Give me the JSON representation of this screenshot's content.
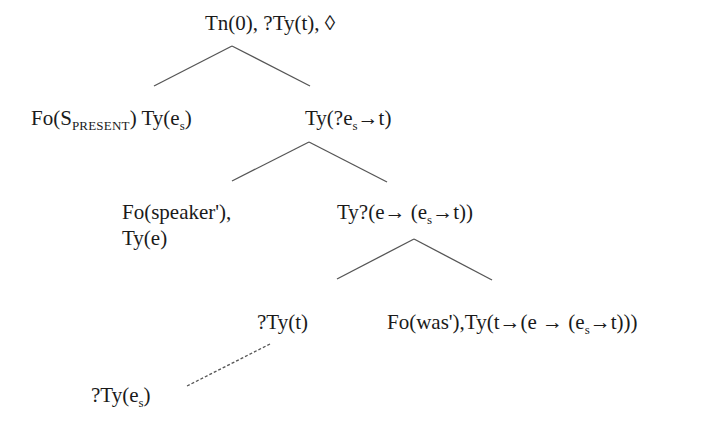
{
  "diagram": {
    "type": "dynamic-syntax-tree",
    "colors": {
      "text": "#1a1a1a",
      "edge": "#555555",
      "background": "#ffffff"
    },
    "nodes": {
      "root": {
        "text": "Tn(0), ?Ty(t), ◊"
      },
      "left1": {
        "p1": "Fo(",
        "p1_main": "S",
        "p1_sub": "PRESENT",
        "p1_close": ")",
        "p2": " Ty(e",
        "p2_sub": "s",
        "p2_close": ")"
      },
      "right1": {
        "p1": "Ty(?e",
        "p1_sub": "s",
        "p1_rest": "→t)"
      },
      "left2": {
        "line1": "Fo(speaker'),",
        "line2": "Ty(e)"
      },
      "right2": {
        "p1": "Ty?(e→ (e",
        "p1_sub": "s",
        "p1_rest": "→t))"
      },
      "left3": {
        "text": "?Ty(t)"
      },
      "right3": {
        "p1": "Fo(was'),Ty(t→(e → (e",
        "p1_sub": "s",
        "p1_rest": "→t)))"
      },
      "unfixed": {
        "p1": "?Ty(e",
        "p1_sub": "s",
        "p1_rest": ")"
      }
    },
    "edges": [
      {
        "from": "root",
        "to": "left1",
        "style": "solid"
      },
      {
        "from": "root",
        "to": "right1",
        "style": "solid"
      },
      {
        "from": "right1",
        "to": "left2",
        "style": "solid"
      },
      {
        "from": "right1",
        "to": "right2",
        "style": "solid"
      },
      {
        "from": "right2",
        "to": "left3",
        "style": "solid"
      },
      {
        "from": "right2",
        "to": "right3",
        "style": "solid"
      },
      {
        "from": "left3",
        "to": "unfixed",
        "style": "dashed"
      }
    ]
  }
}
